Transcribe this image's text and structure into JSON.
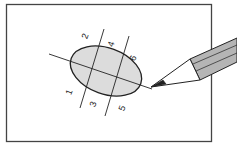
{
  "diagram": {
    "labels": [
      {
        "id": "1",
        "text": "1"
      },
      {
        "id": "2",
        "text": "2"
      },
      {
        "id": "3",
        "text": "3"
      },
      {
        "id": "4",
        "text": "4"
      },
      {
        "id": "5",
        "text": "5"
      },
      {
        "id": "6",
        "text": "6"
      }
    ],
    "colors": {
      "paper": "#ffffff",
      "frame": "#444444",
      "ellipse_fill": "#dcdcdc",
      "line": "#222222",
      "pencil_body": "#b5b5b5",
      "pencil_dark": "#8a8a8a"
    }
  }
}
